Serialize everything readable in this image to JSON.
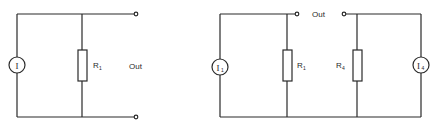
{
  "diagram": {
    "type": "circuit-schematic",
    "background": "#ffffff",
    "line_color": "#2a2a2a",
    "circuits": [
      {
        "id": "left-circuit",
        "components": {
          "source": {
            "symbol": "I",
            "subscript": ""
          },
          "resistor": {
            "symbol": "R",
            "subscript": "1"
          },
          "output_label": "Out"
        }
      },
      {
        "id": "right-circuit",
        "components": {
          "source_left": {
            "symbol": "I",
            "subscript": "1"
          },
          "resistor_left": {
            "symbol": "R",
            "subscript": "1"
          },
          "output_label": "Out",
          "resistor_right": {
            "symbol": "R",
            "subscript": "4"
          },
          "source_right": {
            "symbol": "I",
            "subscript": "4"
          }
        }
      }
    ]
  }
}
